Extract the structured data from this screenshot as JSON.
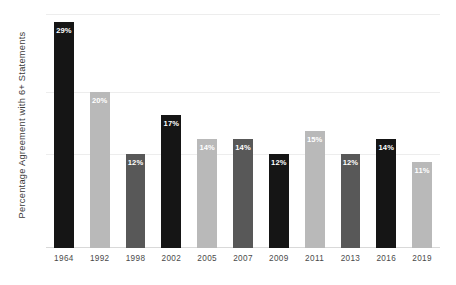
{
  "chart_data": {
    "type": "bar",
    "title": "",
    "subtitle": "",
    "xlabel": "",
    "ylabel": "Percentage Agreement with 6+ Statements",
    "categories": [
      "1964",
      "1992",
      "1998",
      "2002",
      "2005",
      "2007",
      "2009",
      "2011",
      "2013",
      "2016",
      "2019"
    ],
    "values": [
      29,
      20,
      12,
      17,
      14,
      14,
      12,
      15,
      12,
      14,
      11
    ],
    "value_labels": [
      "29%",
      "20%",
      "12%",
      "17%",
      "14%",
      "14%",
      "12%",
      "15%",
      "12%",
      "14%",
      "11%"
    ],
    "bar_colors": [
      "#151515",
      "#b9b9b9",
      "#585858",
      "#151515",
      "#b9b9b9",
      "#585858",
      "#151515",
      "#b9b9b9",
      "#585858",
      "#151515",
      "#b9b9b9"
    ],
    "ylim": [
      0,
      30
    ],
    "y_tick_values": [
      12,
      20,
      30
    ],
    "y_tick_labels": [
      "",
      "",
      ""
    ],
    "grid": true,
    "grid_color": "#ededed",
    "legend": false,
    "legend_position": "none",
    "axis_line_color": "#d9d9d9",
    "value_label_color": "#ffffff",
    "background_color": "#ffffff",
    "tick_label_color": "#4a4a4a",
    "axis_title_color": "#3b3b3b"
  }
}
